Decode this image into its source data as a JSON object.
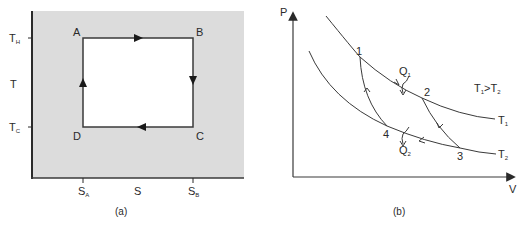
{
  "figure_a": {
    "caption": "(a)",
    "y_axis_label": "T",
    "x_axis_label": "S",
    "y_ticks": [
      {
        "main": "T",
        "sub": "H"
      },
      {
        "main": "T",
        "sub": "C"
      }
    ],
    "x_ticks": [
      {
        "main": "S",
        "sub": "A"
      },
      {
        "main": "S",
        "sub": "B"
      }
    ],
    "corners": {
      "top_left": "A",
      "top_right": "B",
      "bottom_right": "C",
      "bottom_left": "D"
    },
    "colors": {
      "background_shade": "#dcdcdc",
      "cycle_fill": "#ffffff",
      "line": "#3a3a3a"
    }
  },
  "figure_b": {
    "caption": "(b)",
    "y_axis_label": "P",
    "x_axis_label": "V",
    "points": [
      "1",
      "2",
      "3",
      "4"
    ],
    "heat_in": {
      "main": "Q",
      "sub": "1"
    },
    "heat_out": {
      "main": "Q",
      "sub": "2"
    },
    "isotherm_upper": {
      "main": "T",
      "sub": "1"
    },
    "isotherm_lower": {
      "main": "T",
      "sub": "2"
    },
    "condition": {
      "a": "T",
      "a_sub": "1",
      "op": ">",
      "b": "T",
      "b_sub": "2"
    }
  }
}
